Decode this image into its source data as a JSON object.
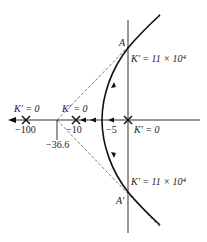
{
  "diagram": {
    "type": "root-locus",
    "real_axis": {
      "tick_labels": [
        "−100",
        "−36.6",
        "−10",
        "−5"
      ],
      "tick_values": [
        -100,
        -36.6,
        -10,
        -5
      ]
    },
    "poles": [
      {
        "value": -100,
        "label": "K′ = 0"
      },
      {
        "value": -10,
        "label": "K′ = 0"
      },
      {
        "value": 0,
        "label": "K′ = 0"
      }
    ],
    "breakaway_point": {
      "value": -36.6,
      "label": "−36.6"
    },
    "crossing_points": [
      {
        "name": "A",
        "label": "A",
        "gain_label": "K′ = 11 × 10⁴"
      },
      {
        "name": "A-prime",
        "label": "A′",
        "gain_label": "K′ = 11 × 10⁴"
      }
    ],
    "labels": {
      "pole_m100_gain": "K′ = 0",
      "pole_m10_gain": "K′ = 0",
      "pole_0_gain": "K′ = 0",
      "tick_m100": "−100",
      "tick_m10": "−10",
      "tick_m5": "−5",
      "tick_m366": "−36.6",
      "point_a": "A",
      "point_a_prime": "A′",
      "gain_a": "K′ = 11 × 10⁴",
      "gain_a_prime": "K′ = 11 × 10⁴"
    }
  }
}
